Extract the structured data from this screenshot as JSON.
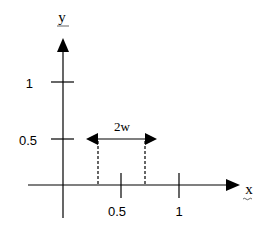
{
  "diagram": {
    "axes": {
      "x_label": "x",
      "y_label": "y"
    },
    "y_ticks": [
      {
        "label": "1",
        "value": 1
      },
      {
        "label": "0.5",
        "value": 0.5
      }
    ],
    "x_ticks": [
      {
        "label": "0.5",
        "value": 0.5
      },
      {
        "label": "1",
        "value": 1
      }
    ],
    "interval": {
      "label": "2w",
      "height": 0.5,
      "description": "double-headed arrow spanning width 2w at y=0.5, with dashed verticals down to x-axis"
    },
    "colors": {
      "line": "#000000",
      "background": "#ffffff"
    }
  }
}
